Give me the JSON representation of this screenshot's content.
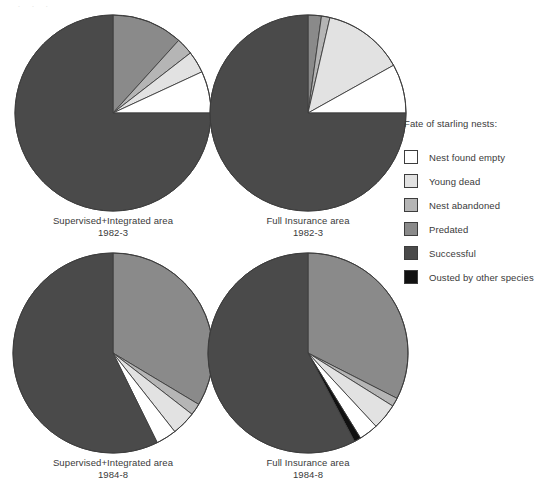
{
  "figure": {
    "legend_title": "Fate of starling nests:",
    "top_artifact": ". . ."
  },
  "colors": {
    "nest_found_empty": "#ffffff",
    "young_dead": "#e2e2e2",
    "nest_abandoned": "#b5b5b5",
    "predated": "#8a8a8a",
    "successful": "#4a4a4a",
    "ousted_by_other_species": "#111111",
    "outline": "#3d3d3d",
    "text": "#3a3a3a"
  },
  "legend": {
    "items": [
      {
        "key": "nest_found_empty",
        "label": "Nest found empty",
        "color": "#ffffff"
      },
      {
        "key": "young_dead",
        "label": "Young dead",
        "color": "#e2e2e2"
      },
      {
        "key": "nest_abandoned",
        "label": "Nest abandoned",
        "color": "#b5b5b5"
      },
      {
        "key": "predated",
        "label": "Predated",
        "color": "#8a8a8a"
      },
      {
        "key": "successful",
        "label": "Successful",
        "color": "#4a4a4a"
      },
      {
        "key": "ousted_by_other_species",
        "label": "Ousted by other species",
        "color": "#111111"
      }
    ]
  },
  "charts": [
    {
      "id": "pie-supervised-integrated-1982-3",
      "caption_line1": "Supervised+Integrated area",
      "caption_line2": "1982-3"
    },
    {
      "id": "pie-full-insurance-1982-3",
      "caption_line1": "Full Insurance area",
      "caption_line2": "1982-3"
    },
    {
      "id": "pie-supervised-integrated-1984-8",
      "caption_line1": "Supervised+Integrated area",
      "caption_line2": "1984-8"
    },
    {
      "id": "pie-full-insurance-1984-8",
      "caption_line1": "Full Insurance area",
      "caption_line2": "1984-8"
    }
  ],
  "chart_data": [
    {
      "type": "pie",
      "title": "Supervised+Integrated area 1982-3",
      "start_angle_deg": 0,
      "direction": "clockwise",
      "labels": [
        "Predated",
        "Nest abandoned",
        "Young dead",
        "Nest found empty",
        "Successful"
      ],
      "values": [
        11.7,
        2.8,
        3.6,
        6.9,
        75.0
      ],
      "unit": "percent",
      "legend_position": "right",
      "colors": [
        "#8a8a8a",
        "#b5b5b5",
        "#e2e2e2",
        "#ffffff",
        "#4a4a4a"
      ]
    },
    {
      "type": "pie",
      "title": "Full Insurance area 1982-3",
      "start_angle_deg": 0,
      "direction": "clockwise",
      "labels": [
        "Predated",
        "Nest abandoned",
        "Young dead",
        "Nest found empty",
        "Successful"
      ],
      "values": [
        2.2,
        1.4,
        13.3,
        8.1,
        75.0
      ],
      "unit": "percent",
      "legend_position": "right",
      "colors": [
        "#8a8a8a",
        "#b5b5b5",
        "#e2e2e2",
        "#ffffff",
        "#4a4a4a"
      ]
    },
    {
      "type": "pie",
      "title": "Supervised+Integrated area 1984-8",
      "start_angle_deg": 0,
      "direction": "clockwise",
      "labels": [
        "Predated",
        "Nest abandoned",
        "Young dead",
        "Nest found empty",
        "Successful"
      ],
      "values": [
        33.6,
        1.9,
        3.9,
        3.3,
        57.3
      ],
      "unit": "percent",
      "legend_position": "right",
      "colors": [
        "#8a8a8a",
        "#b5b5b5",
        "#e2e2e2",
        "#ffffff",
        "#4a4a4a"
      ]
    },
    {
      "type": "pie",
      "title": "Full Insurance area 1984-8",
      "start_angle_deg": 0,
      "direction": "clockwise",
      "labels": [
        "Predated",
        "Nest abandoned",
        "Young dead",
        "Nest found empty",
        "Ousted by other species",
        "Successful"
      ],
      "values": [
        32.5,
        1.4,
        4.2,
        3.1,
        1.1,
        57.7
      ],
      "unit": "percent",
      "legend_position": "right",
      "colors": [
        "#8a8a8a",
        "#b5b5b5",
        "#e2e2e2",
        "#ffffff",
        "#111111",
        "#4a4a4a"
      ]
    }
  ]
}
